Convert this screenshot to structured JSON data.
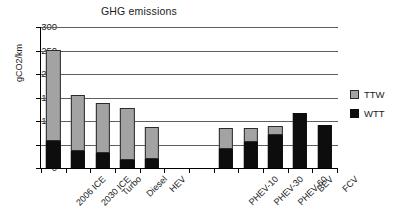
{
  "chart_data": {
    "type": "bar",
    "title": "GHG emissions",
    "xlabel": "",
    "ylabel": "gCO2/km",
    "ylim": [
      0,
      300
    ],
    "yticks": [
      0,
      50,
      100,
      150,
      200,
      250,
      300
    ],
    "grid": true,
    "stacked": true,
    "legend_position": "right",
    "categories": [
      "2006 ICE",
      "2030 ICE",
      "Turbo",
      "Diesel",
      "HEV",
      "",
      "",
      "PHEV-10",
      "PHEV-30",
      "PHEV-60",
      "BEV",
      "FCV"
    ],
    "series": [
      {
        "name": "WTT",
        "color": "#0d0d0d",
        "values": [
          57,
          37,
          32,
          18,
          20,
          null,
          null,
          40,
          55,
          70,
          118,
          92
        ]
      },
      {
        "name": "TTW",
        "color": "#a3a3a3",
        "values": [
          194,
          118,
          106,
          109,
          68,
          null,
          null,
          45,
          30,
          20,
          0,
          0
        ]
      }
    ],
    "totals": [
      251,
      155,
      138,
      127,
      88,
      null,
      null,
      85,
      85,
      90,
      118,
      92
    ]
  },
  "legend": {
    "items": [
      {
        "label": "TTW",
        "swatch": "ttw-swatch"
      },
      {
        "label": "WTT",
        "swatch": "wtt-swatch"
      }
    ]
  }
}
